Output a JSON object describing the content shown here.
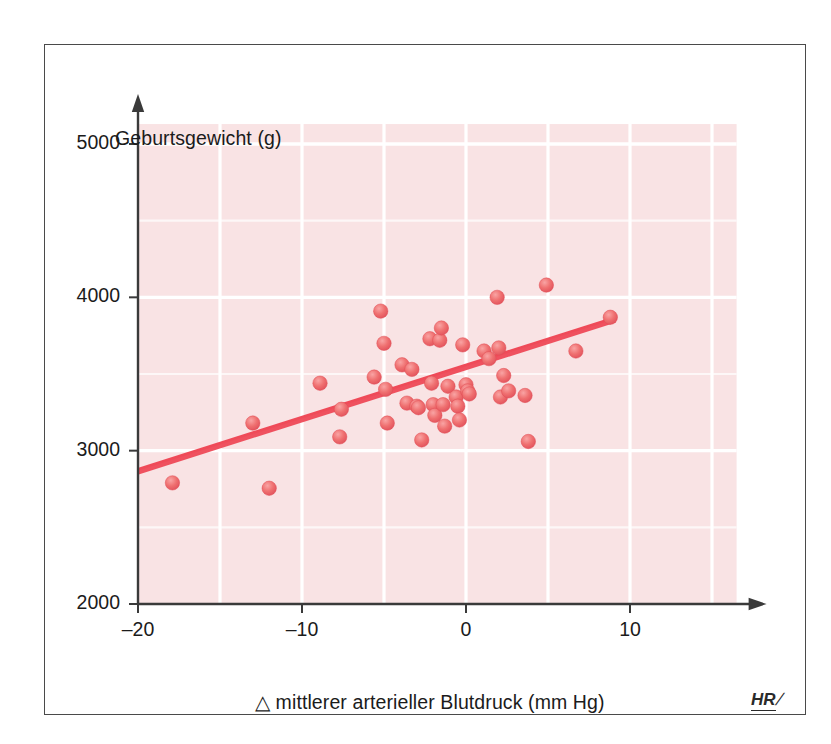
{
  "figure": {
    "border_color": "#4a4a4a",
    "page_background": "#ffffff",
    "plot_background": "#f9e3e4",
    "gridline_color": "#ffffff",
    "axis_color": "#3a3a3a",
    "marker_color": "#ee6e6e",
    "marker_edge_color": "#e04d55",
    "trend_line_color": "#ef4a58",
    "watermark_letters": "HR",
    "watermark_slash": "/"
  },
  "chart_data": {
    "type": "scatter",
    "title": "",
    "xlabel": "△ mittlerer arterieller Blutdruck (mm Hg)",
    "ylabel": "Geburtsgewicht (g)",
    "xlim": [
      -20.9,
      16.6
    ],
    "ylim": [
      2000,
      5130
    ],
    "xticks": [
      -20,
      -10,
      0,
      10
    ],
    "xticklabels": [
      "–20",
      "–10",
      "0",
      "10"
    ],
    "yticks": [
      2000,
      3000,
      4000,
      5000
    ],
    "yticklabels": [
      "2000",
      "3000",
      "4000",
      "5000"
    ],
    "xgrid_minor": [
      -15,
      -5,
      5
    ],
    "grid": true,
    "grid_orientation": "both",
    "legend": "none",
    "series": [
      {
        "name": "Neugeborene",
        "marker": "circle",
        "points": [
          [
            -17.9,
            2790
          ],
          [
            -13.0,
            3180
          ],
          [
            -12.0,
            2755
          ],
          [
            -8.9,
            3440
          ],
          [
            -7.7,
            3090
          ],
          [
            -7.6,
            3270
          ],
          [
            -5.6,
            3480
          ],
          [
            -5.2,
            3910
          ],
          [
            -5.0,
            3700
          ],
          [
            -4.9,
            3400
          ],
          [
            -4.8,
            3180
          ],
          [
            -3.9,
            3560
          ],
          [
            -3.6,
            3310
          ],
          [
            -3.3,
            3530
          ],
          [
            -3.0,
            3290
          ],
          [
            -2.9,
            3280
          ],
          [
            -2.7,
            3070
          ],
          [
            -2.2,
            3730
          ],
          [
            -2.1,
            3440
          ],
          [
            -2.0,
            3300
          ],
          [
            -1.9,
            3230
          ],
          [
            -1.6,
            3720
          ],
          [
            -1.5,
            3800
          ],
          [
            -1.4,
            3300
          ],
          [
            -1.3,
            3160
          ],
          [
            -1.1,
            3420
          ],
          [
            -0.6,
            3350
          ],
          [
            -0.5,
            3290
          ],
          [
            -0.4,
            3200
          ],
          [
            -0.2,
            3690
          ],
          [
            0.0,
            3430
          ],
          [
            0.1,
            3390
          ],
          [
            0.2,
            3370
          ],
          [
            1.1,
            3650
          ],
          [
            1.4,
            3600
          ],
          [
            1.9,
            4000
          ],
          [
            2.0,
            3670
          ],
          [
            2.1,
            3350
          ],
          [
            2.3,
            3490
          ],
          [
            2.6,
            3390
          ],
          [
            3.6,
            3360
          ],
          [
            3.8,
            3060
          ],
          [
            4.9,
            4080
          ],
          [
            6.7,
            3650
          ],
          [
            8.8,
            3870
          ]
        ]
      }
    ],
    "trend_line": {
      "name": "Regressionsgerade",
      "x_start": -20.0,
      "y_start": 2870,
      "x_end": 9.1,
      "y_end": 3860
    }
  }
}
